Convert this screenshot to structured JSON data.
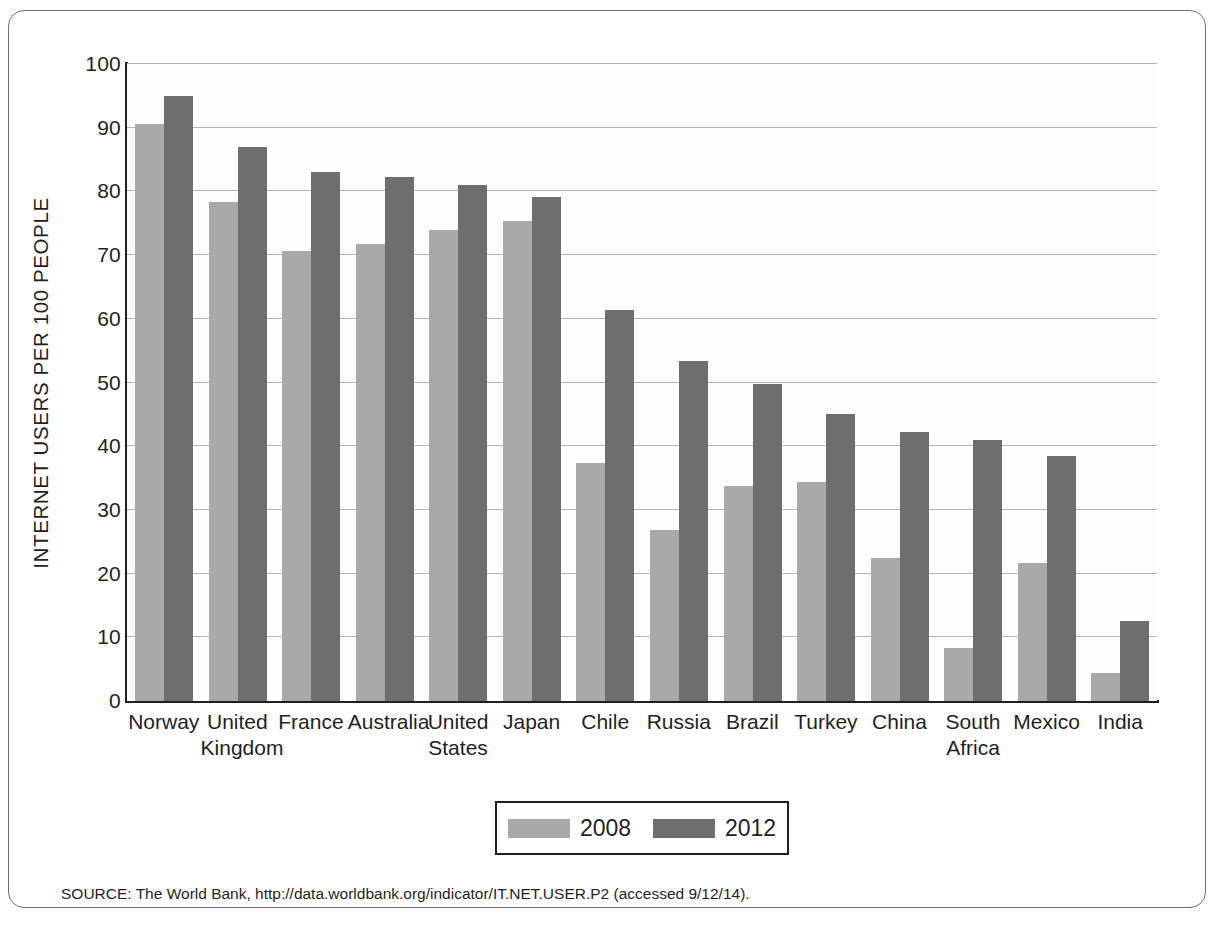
{
  "figure": {
    "source_note": "SOURCE: The World Bank, http://data.worldbank.org/indicator/IT.NET.USER.P2 (accessed 9/12/14)."
  },
  "legend": {
    "entries": [
      {
        "label": "2008",
        "color": "#a9a9a9"
      },
      {
        "label": "2012",
        "color": "#6e6e6e"
      }
    ]
  },
  "chart_data": {
    "type": "bar",
    "title": "",
    "xlabel": "",
    "ylabel": "INTERNET USERS PER 100 PEOPLE",
    "ylim": [
      0,
      100
    ],
    "yticks": [
      0,
      10,
      20,
      30,
      40,
      50,
      60,
      70,
      80,
      90,
      100
    ],
    "ytick_labels": [
      "0",
      "10",
      "20",
      "30",
      "40",
      "50",
      "60",
      "70",
      "80",
      "90",
      "100"
    ],
    "grid": true,
    "legend_position": "bottom-center",
    "categories": [
      "Norway",
      "United\nKingdom",
      "France",
      "Australia",
      "United\nStates",
      "Japan",
      "Chile",
      "Russia",
      "Brazil",
      "Turkey",
      "China",
      "South\nAfrica",
      "Mexico",
      "India"
    ],
    "series": [
      {
        "name": "2008",
        "color": "#a9a9a9",
        "values": [
          90.6,
          78.4,
          70.7,
          71.7,
          74.0,
          75.4,
          37.3,
          26.8,
          33.8,
          34.4,
          22.5,
          8.4,
          21.7,
          4.4
        ]
      },
      {
        "name": "2012",
        "color": "#6e6e6e",
        "values": [
          95.0,
          87.0,
          83.0,
          82.3,
          81.0,
          79.1,
          61.4,
          53.3,
          49.8,
          45.0,
          42.3,
          41.0,
          38.4,
          12.6
        ]
      }
    ]
  }
}
